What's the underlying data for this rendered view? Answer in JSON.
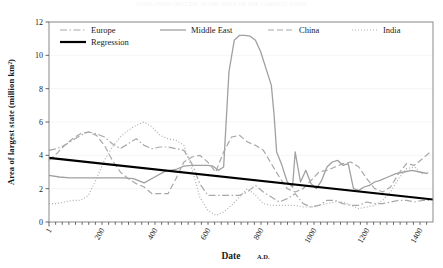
{
  "figure": {
    "top_faint_text": "LONG-TERM DECLINE IN THE AREA OF THE LARGEST STATE",
    "background": "#ffffff",
    "plot_border_color": "#808080"
  },
  "chart_data": {
    "type": "line",
    "title": "",
    "subtitle": "",
    "xlabel": "Date",
    "xlabel_suffix": "A.D.",
    "ylabel": "Area of largest state (million km²)",
    "xlim": [
      1,
      1450
    ],
    "ylim": [
      0,
      12
    ],
    "xticks": [
      1,
      200,
      400,
      600,
      800,
      1000,
      1200,
      1400
    ],
    "xtick_labels": [
      "1",
      "200",
      "400",
      "600",
      "800",
      "1000",
      "1200",
      "1400"
    ],
    "yticks": [
      0,
      2,
      4,
      6,
      8,
      10,
      12
    ],
    "ytick_labels": [
      "0",
      "2",
      "4",
      "6",
      "8",
      "10",
      "12"
    ],
    "grid": "horizontal-faint",
    "legend_position": "top-inside",
    "series": [
      {
        "name": "Europe",
        "style": "dash-dot",
        "color": "#a8a8a8",
        "x": [
          1,
          30,
          60,
          90,
          120,
          150,
          180,
          210,
          240,
          270,
          300,
          330,
          360,
          390,
          420,
          450,
          480,
          510,
          540,
          570,
          600,
          630,
          660,
          690,
          720,
          750,
          780,
          810,
          840,
          870,
          900,
          930,
          960,
          990,
          1020,
          1050,
          1080,
          1110,
          1140,
          1170,
          1200,
          1230,
          1260,
          1290,
          1320,
          1350,
          1380,
          1410,
          1440
        ],
        "values": [
          4.3,
          4.4,
          4.6,
          4.9,
          5.2,
          5.4,
          5.3,
          5.1,
          4.7,
          4.4,
          4.7,
          5.0,
          4.6,
          4.4,
          4.5,
          4.5,
          4.4,
          4.3,
          3.5,
          2.3,
          1.6,
          1.6,
          1.6,
          1.6,
          1.6,
          1.8,
          2.2,
          1.8,
          1.5,
          1.2,
          1.4,
          1.7,
          1.1,
          0.9,
          1.0,
          1.3,
          1.3,
          1.1,
          1.0,
          1.0,
          1.2,
          1.1,
          1.1,
          1.2,
          1.3,
          1.3,
          1.2,
          1.3,
          1.3
        ]
      },
      {
        "name": "Middle East",
        "style": "solid",
        "color": "#a0a0a0",
        "x": [
          1,
          40,
          80,
          120,
          160,
          200,
          240,
          280,
          320,
          360,
          400,
          440,
          480,
          510,
          540,
          560,
          580,
          600,
          620,
          640,
          660,
          680,
          700,
          720,
          740,
          760,
          780,
          800,
          820,
          840,
          850,
          860,
          880,
          900,
          920,
          930,
          950,
          970,
          990,
          1010,
          1030,
          1050,
          1070,
          1090,
          1110,
          1130,
          1150,
          1170,
          1190,
          1210,
          1230,
          1250,
          1280,
          1310,
          1340,
          1370,
          1400,
          1430
        ],
        "values": [
          2.8,
          2.7,
          2.65,
          2.65,
          2.65,
          2.65,
          2.65,
          2.65,
          2.6,
          2.35,
          2.7,
          3.05,
          3.15,
          3.35,
          3.4,
          3.4,
          3.4,
          3.4,
          3.35,
          3.1,
          3.3,
          9.0,
          10.9,
          11.2,
          11.2,
          11.15,
          10.9,
          10.2,
          9.2,
          8.2,
          6.5,
          4.2,
          3.4,
          2.4,
          2.1,
          4.2,
          2.4,
          3.1,
          2.3,
          2.0,
          2.5,
          3.3,
          3.6,
          3.7,
          3.4,
          3.5,
          2.0,
          1.9,
          2.1,
          2.2,
          2.4,
          2.5,
          2.7,
          2.9,
          3.0,
          3.1,
          3.0,
          2.9
        ]
      },
      {
        "name": "China",
        "style": "long-dash",
        "color": "#a8a8a8",
        "x": [
          1,
          30,
          60,
          90,
          120,
          150,
          180,
          210,
          240,
          270,
          300,
          330,
          360,
          390,
          420,
          450,
          480,
          510,
          540,
          570,
          600,
          630,
          660,
          690,
          720,
          750,
          780,
          810,
          840,
          870,
          900,
          930,
          960,
          990,
          1020,
          1050,
          1080,
          1110,
          1140,
          1170,
          1200,
          1230,
          1260,
          1290,
          1320,
          1350,
          1380,
          1410,
          1440
        ],
        "values": [
          3.7,
          4.1,
          4.6,
          5.0,
          5.3,
          5.4,
          5.2,
          4.6,
          3.7,
          3.0,
          2.6,
          2.3,
          2.1,
          1.7,
          1.7,
          1.7,
          2.6,
          3.6,
          3.9,
          4.0,
          3.6,
          3.0,
          4.2,
          5.1,
          5.2,
          4.8,
          4.6,
          4.3,
          3.5,
          2.7,
          2.0,
          1.8,
          2.0,
          2.5,
          3.0,
          3.1,
          3.3,
          3.5,
          3.6,
          3.3,
          2.6,
          2.0,
          1.8,
          2.1,
          2.9,
          3.5,
          3.4,
          3.8,
          4.2
        ]
      },
      {
        "name": "India",
        "style": "dotted",
        "color": "#b0b0b0",
        "x": [
          1,
          30,
          60,
          90,
          120,
          150,
          180,
          210,
          240,
          270,
          300,
          330,
          360,
          390,
          420,
          450,
          480,
          510,
          540,
          570,
          600,
          630,
          660,
          690,
          720,
          750,
          780,
          810,
          840,
          870,
          900,
          930,
          960,
          990,
          1020,
          1050,
          1080,
          1110,
          1140,
          1170,
          1200,
          1230,
          1260,
          1290,
          1320,
          1350,
          1380,
          1410,
          1440
        ],
        "values": [
          1.1,
          1.1,
          1.2,
          1.3,
          1.3,
          1.6,
          2.6,
          3.7,
          4.5,
          5.1,
          5.5,
          5.8,
          6.0,
          5.7,
          5.2,
          5.0,
          4.9,
          4.6,
          3.2,
          1.5,
          0.7,
          0.4,
          0.6,
          1.0,
          1.5,
          2.0,
          1.6,
          1.1,
          1.0,
          1.0,
          1.0,
          1.0,
          0.9,
          0.9,
          1.0,
          1.1,
          1.2,
          1.2,
          1.0,
          0.8,
          0.9,
          1.0,
          1.3,
          1.8,
          2.6,
          3.2,
          3.3,
          2.9,
          3.0
        ]
      },
      {
        "name": "Regression",
        "style": "solid-bold",
        "color": "#000000",
        "x": [
          1,
          1450
        ],
        "values": [
          3.85,
          1.35
        ]
      }
    ],
    "legend": [
      {
        "label": "Europe",
        "style": "dash-dot",
        "color": "#a8a8a8"
      },
      {
        "label": "Middle East",
        "style": "solid",
        "color": "#a0a0a0"
      },
      {
        "label": "China",
        "style": "long-dash",
        "color": "#a8a8a8"
      },
      {
        "label": "India",
        "style": "dotted",
        "color": "#b0b0b0"
      },
      {
        "label": "Regression",
        "style": "solid-bold",
        "color": "#000000"
      }
    ]
  }
}
